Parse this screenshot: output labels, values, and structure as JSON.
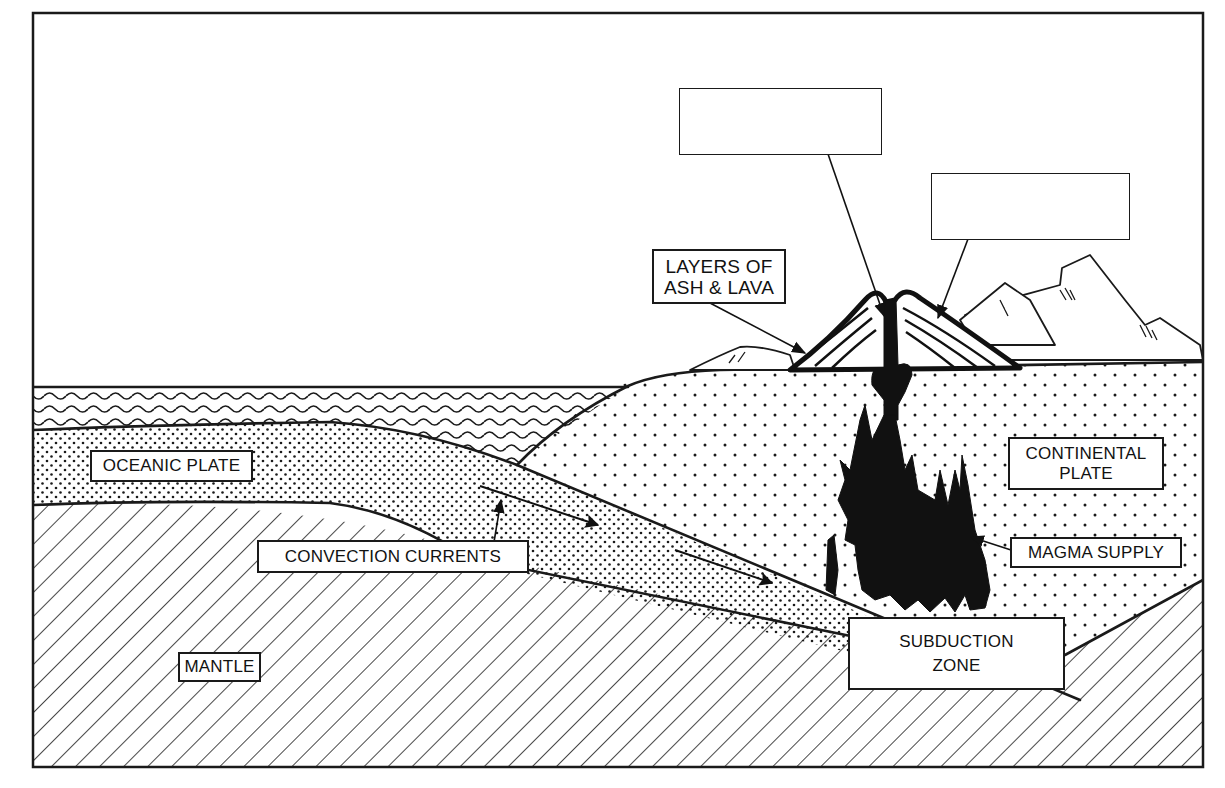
{
  "diagram": {
    "title": "",
    "frame": {
      "x": 33,
      "y": 13,
      "width": 1170,
      "height": 754
    },
    "colors": {
      "ink": "#1a1a1a",
      "paper": "#ffffff",
      "magma": "#111111"
    },
    "layers": [
      {
        "id": "ocean-water",
        "pattern": "wavy-lines"
      },
      {
        "id": "oceanic-plate",
        "pattern": "dense-dots"
      },
      {
        "id": "continental-plate",
        "pattern": "sparse-dots"
      },
      {
        "id": "mantle",
        "pattern": "diagonal-hatch"
      },
      {
        "id": "magma",
        "pattern": "solid-black"
      }
    ],
    "labels": {
      "blank_top": {
        "line1": "",
        "line2": ""
      },
      "blank_right": {
        "line1": "",
        "line2": ""
      },
      "ash_lava": {
        "line1": "LAYERS OF",
        "line2": "ASH & LAVA"
      },
      "oceanic_plate": {
        "line1": "OCEANIC PLATE"
      },
      "continental_plate": {
        "line1": "CONTINENTAL",
        "line2": "PLATE"
      },
      "convection_currents": {
        "line1": "CONVECTION CURRENTS"
      },
      "magma_supply": {
        "line1": "MAGMA SUPPLY"
      },
      "subduction_zone": {
        "line1": "SUBDUCTION",
        "line2": "ZONE"
      },
      "mantle": {
        "line1": "MANTLE"
      }
    },
    "arrows": [
      {
        "from": "blank_top",
        "to": "volcano-vent"
      },
      {
        "from": "blank_right",
        "to": "volcano-slope"
      },
      {
        "from": "ash_lava",
        "to": "volcano-flank"
      },
      {
        "from": "convection_currents",
        "to": "oceanic-plate-base"
      },
      {
        "from": "magma_supply",
        "to": "magma-chamber"
      },
      {
        "type": "motion",
        "direction": "down-right",
        "location": "oceanic-plate"
      },
      {
        "type": "motion",
        "direction": "down-right",
        "location": "oceanic-plate"
      }
    ]
  }
}
